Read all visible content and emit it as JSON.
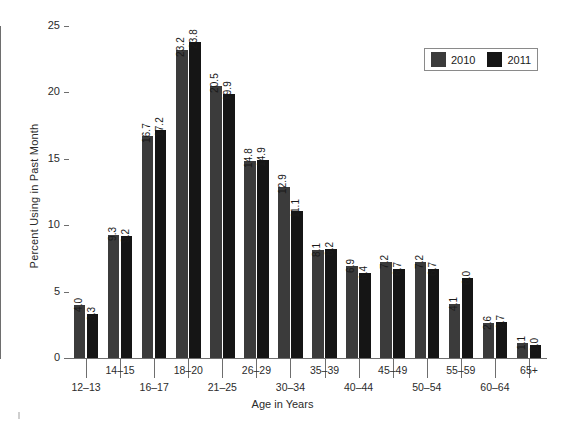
{
  "chart_data": {
    "type": "bar",
    "title": "",
    "xlabel": "Age in Years",
    "ylabel": "Percent Using in Past Month",
    "categories": [
      "12–13",
      "14–15",
      "16–17",
      "18–20",
      "21–25",
      "26–29",
      "30–34",
      "35–39",
      "40–44",
      "45–49",
      "50–54",
      "55–59",
      "60–64",
      "65+"
    ],
    "series": [
      {
        "name": "2010",
        "color": "#3b3b3b",
        "values": [
          4.0,
          9.3,
          16.7,
          23.2,
          20.5,
          14.8,
          12.9,
          8.1,
          6.9,
          7.2,
          7.2,
          4.1,
          2.6,
          1.1
        ],
        "labels": [
          "4.0",
          "9.3",
          "16.7",
          "23.2",
          "20.5",
          "14.8",
          "12.9",
          "8.1",
          "6.9",
          "7.2",
          "7.2",
          "4.1",
          "2.6",
          "1.1"
        ]
      },
      {
        "name": "2011",
        "color": "#151515",
        "values": [
          3.3,
          9.2,
          17.2,
          23.8,
          19.9,
          14.9,
          11.1,
          8.2,
          6.4,
          6.7,
          6.7,
          6.0,
          2.7,
          1.0
        ],
        "labels": [
          "3.3",
          "9.2",
          "17.2",
          "23.8",
          "19.9",
          "14.9",
          "11.1",
          "8.2",
          "6.4",
          "6.7",
          "6.7",
          "6.0",
          "2.7",
          "1.0"
        ]
      }
    ],
    "ylim": [
      0,
      25
    ],
    "yticks": [
      0,
      5,
      10,
      15,
      20,
      25
    ],
    "ytick_labels": [
      "0",
      "5",
      "10",
      "15",
      "20",
      "25"
    ],
    "grid": false,
    "legend_position": "top-right",
    "bar_value_labels_rotated": true
  },
  "legend": {
    "entries": [
      {
        "label": "2010",
        "color": "#3b3b3b"
      },
      {
        "label": "2011",
        "color": "#151515"
      }
    ]
  },
  "axes": {
    "y_title": "Percent Using in Past Month",
    "x_title": "Age in Years"
  }
}
